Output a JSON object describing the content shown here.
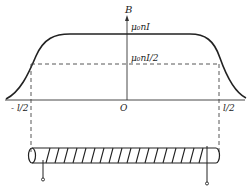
{
  "diagram": {
    "axis_y_label": "B",
    "origin_label": "O",
    "max_label": "μ₀nI",
    "half_label": "μ₀nI/2",
    "left_end_label": "- l/2",
    "right_end_label": "l/2",
    "colors": {
      "line": "#222222",
      "dash": "#444444",
      "background": "#ffffff"
    }
  }
}
